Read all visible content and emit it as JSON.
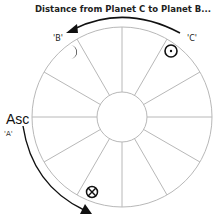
{
  "diagram": {
    "title": "Distance from Planet C to Planet B...",
    "labels": {
      "b": "'B'",
      "c": "'C'",
      "asc": "Asc",
      "a": "'A'"
    },
    "wheel": {
      "center": [
        122,
        117
      ],
      "outer_radius": 90,
      "inner_radius": 25,
      "house_divisions": 12,
      "line_color": "#b8b8b8"
    },
    "planets": [
      {
        "name": "Moon",
        "symbol": "moon-icon",
        "label": "'B'"
      },
      {
        "name": "Sun",
        "symbol": "sun-icon",
        "label": "'C'"
      },
      {
        "name": "Part of Fortune",
        "symbol": "part-of-fortune-icon"
      }
    ],
    "arrows": [
      {
        "from": "C",
        "to": "B",
        "direction": "counter-clockwise"
      },
      {
        "from": "Asc",
        "to": "Part of Fortune",
        "direction": "counter-clockwise"
      }
    ]
  }
}
